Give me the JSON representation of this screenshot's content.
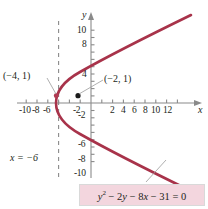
{
  "figure": {
    "kind": "parabola-graph",
    "background": "#ffffff",
    "curve_color": "#a8334a",
    "axis_color": "#8a8a8a",
    "text_color": "#231f20",
    "equation_box_fill": "#f3d6de",
    "equation_box_border": "#d9d9d9",
    "leader_line_color": "#9a9a9a"
  },
  "axes": {
    "x_axis_label": "x",
    "y_axis_label": "y",
    "x_ticks": [
      "-10",
      "-8",
      "-6",
      "-2",
      "2",
      "4",
      "6",
      "8",
      "10",
      "12"
    ],
    "x_tick_values": [
      -10,
      -8,
      -6,
      -2,
      2,
      4,
      6,
      8,
      10,
      12
    ],
    "y_ticks": [
      "10",
      "8",
      "4",
      "-2",
      "-6",
      "-8",
      "-10"
    ],
    "y_tick_values": [
      10,
      8,
      4,
      -2,
      -6,
      -8,
      -10
    ],
    "xlim": [
      -11.5,
      13.5
    ],
    "ylim": [
      -12,
      13
    ]
  },
  "annotations": {
    "vertex_label": "(−4, 1)",
    "focus_label": "(−2, 1)",
    "directrix_label": "x = −6"
  },
  "equation": {
    "lhs_y": "y",
    "exponent": "2",
    "rest": " − 2y − 8x − 31 = 0",
    "full": "y² − 2y − 8x − 31 = 0"
  },
  "chart_data": {
    "type": "line",
    "title": "",
    "xlabel": "x",
    "ylabel": "y",
    "xlim": [
      -11.5,
      13.5
    ],
    "ylim": [
      -12,
      13
    ],
    "grid": false,
    "legend": "none",
    "series": [
      {
        "name": "y² − 2y − 8x − 31 = 0",
        "form": "x = (y² − 2y − 31)/8",
        "vertex": [
          -4,
          1
        ],
        "focus": [
          -2,
          1
        ],
        "directrix_x": -6,
        "opens": "right",
        "color": "#a8334a",
        "points": [
          [
            11.25,
            12
          ],
          [
            8.5,
            11
          ],
          [
            6.0,
            10
          ],
          [
            3.75,
            9
          ],
          [
            1.75,
            8
          ],
          [
            0.0,
            7
          ],
          [
            -1.5,
            6
          ],
          [
            -2.75,
            5
          ],
          [
            -3.75,
            4
          ],
          [
            -4.0,
            3
          ],
          [
            -4.0,
            2
          ],
          [
            -4.0,
            1
          ],
          [
            -4.0,
            0
          ],
          [
            -3.75,
            -1
          ],
          [
            -2.75,
            -3
          ],
          [
            -1.5,
            -4
          ],
          [
            0.0,
            -5
          ],
          [
            1.75,
            -6
          ],
          [
            3.75,
            -7
          ],
          [
            6.0,
            -8
          ],
          [
            8.5,
            -9
          ],
          [
            11.25,
            -10
          ]
        ]
      }
    ],
    "markers": [
      {
        "label": "(−4, 1)",
        "x": -4,
        "y": 1,
        "style": "dot-on-curve",
        "color": "#a8334a"
      },
      {
        "label": "(−2, 1)",
        "x": -2,
        "y": 1,
        "style": "dot",
        "color": "#1a1a1a"
      }
    ],
    "reference_lines": [
      {
        "label": "x = −6",
        "type": "vertical-dashed",
        "x": -6,
        "color": "#8a8a8a"
      }
    ]
  }
}
